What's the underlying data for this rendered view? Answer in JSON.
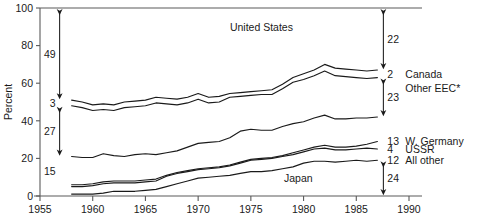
{
  "chart_data": {
    "type": "line",
    "title": "",
    "subtitle": "",
    "xlabel": "",
    "ylabel": "Percent",
    "xlim": [
      1955,
      1990
    ],
    "ylim": [
      0,
      100
    ],
    "grid": false,
    "legend_position": "right-inline",
    "x_ticks": [
      1955,
      1960,
      1965,
      1970,
      1975,
      1980,
      1985,
      1990
    ],
    "y_ticks": [
      0,
      20,
      40,
      60,
      80,
      100
    ],
    "x": [
      1958,
      1959,
      1960,
      1961,
      1962,
      1963,
      1964,
      1965,
      1966,
      1967,
      1968,
      1969,
      1970,
      1971,
      1972,
      1973,
      1974,
      1975,
      1976,
      1977,
      1978,
      1979,
      1980,
      1981,
      1982,
      1983,
      1984,
      1985,
      1986,
      1987
    ],
    "series": [
      {
        "name": "United States",
        "end_value_label": "22",
        "values": [
          51,
          50,
          48.5,
          49,
          48.5,
          50,
          50.5,
          51,
          52.5,
          52,
          51.5,
          52.5,
          54.5,
          52.5,
          53,
          54.5,
          55,
          55.5,
          56,
          56.5,
          59.5,
          63,
          65,
          67,
          70,
          68,
          67.5,
          67,
          66.5,
          67
        ]
      },
      {
        "name": "Canada",
        "end_value_label": "2",
        "values": [
          48,
          47,
          45.5,
          46,
          45.5,
          47,
          47.5,
          48,
          49.5,
          49,
          48.5,
          49.5,
          51.5,
          49.5,
          50,
          52.5,
          53,
          53.5,
          54,
          54,
          57,
          60.5,
          62,
          64,
          66.5,
          64,
          63.5,
          63,
          62.5,
          63
        ]
      },
      {
        "name": "Other EEC*",
        "end_value_label": "23",
        "values": [
          21,
          20.5,
          20.5,
          22.5,
          21.5,
          21,
          22,
          22.5,
          22,
          23,
          24,
          26,
          28,
          28.5,
          29,
          31,
          34.5,
          35.5,
          35,
          35,
          37,
          38.5,
          39.5,
          41.5,
          43,
          41,
          41,
          41.5,
          41.5,
          42
        ]
      },
      {
        "name": "W. Germany",
        "end_value_label": "13",
        "values": [
          6,
          6,
          6.5,
          7.5,
          8,
          8,
          8,
          8.5,
          9,
          11,
          12.5,
          13.5,
          14.5,
          15,
          15.5,
          16.5,
          18,
          19.5,
          20,
          20.5,
          21.5,
          23,
          24.5,
          26,
          27,
          26,
          26,
          26.5,
          27.5,
          29
        ]
      },
      {
        "name": "USSR",
        "end_value_label": "4",
        "values": [
          5,
          5,
          5.5,
          6.5,
          7,
          7,
          7,
          7.5,
          8,
          10.5,
          12,
          13,
          14,
          14.5,
          15,
          16,
          17.5,
          19,
          19.5,
          20,
          21,
          22,
          23.5,
          25,
          25.5,
          24.5,
          24.5,
          25,
          25.5,
          25
        ]
      },
      {
        "name": "All other",
        "end_value_label": "12",
        "values": [
          1,
          1,
          1,
          1.5,
          2.5,
          2.5,
          2.5,
          3,
          3.5,
          5,
          6.5,
          8,
          9.5,
          10,
          10.5,
          11,
          12,
          13,
          13,
          13.5,
          14.5,
          15.5,
          17.5,
          18.5,
          18.5,
          18,
          18.5,
          19,
          18.5,
          19
        ]
      }
    ],
    "annotations": {
      "left": [
        {
          "id": "left-49",
          "label": "49",
          "type": "double-arrow",
          "from": 100,
          "to": 51
        },
        {
          "id": "left-3",
          "label": "3",
          "type": "gap-label",
          "at": 49.5
        },
        {
          "id": "left-27",
          "label": "27",
          "type": "double-arrow",
          "from": 48,
          "to": 21
        },
        {
          "id": "left-15",
          "label": "15",
          "type": "plain-label",
          "at": 13
        }
      ],
      "right": [
        {
          "id": "right-22",
          "label": "22",
          "type": "double-arrow",
          "from": 100,
          "to": 67
        },
        {
          "id": "right-2",
          "label": "2",
          "type": "gap-label",
          "at": 65
        },
        {
          "id": "right-23",
          "label": "23",
          "type": "double-arrow",
          "from": 63,
          "to": 42
        },
        {
          "id": "right-13",
          "label": "13",
          "type": "plain-label",
          "at": 29
        },
        {
          "id": "right-4",
          "label": "4",
          "type": "plain-label",
          "at": 25
        },
        {
          "id": "right-12",
          "label": "12",
          "type": "plain-label",
          "at": 19
        },
        {
          "id": "right-24",
          "label": "24",
          "type": "double-arrow",
          "from": 19,
          "to": 0
        }
      ]
    },
    "inline_labels": [
      {
        "id": "united-states",
        "text": "United States",
        "x": 1976,
        "y": 90
      },
      {
        "id": "japan",
        "text": "Japan",
        "x": 1979.5,
        "y": 9.5
      }
    ],
    "right_series_labels": [
      "Canada",
      "Other EEC*",
      "W. Germany",
      "USSR",
      "All other"
    ],
    "colors": {
      "line": "#1a1a1a",
      "axis": "#5a5a5a",
      "text": "#1a1a1a"
    }
  },
  "axes": {
    "y_title": "Percent",
    "y_tick_labels": [
      "0",
      "20",
      "40",
      "60",
      "80",
      "100"
    ],
    "x_tick_labels": [
      "1955",
      "1960",
      "1965",
      "1970",
      "1975",
      "1980",
      "1985",
      "1990"
    ]
  },
  "footnote": {
    "text": ""
  }
}
